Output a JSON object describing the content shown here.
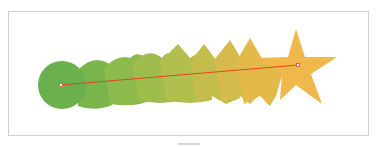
{
  "figure": {
    "start_shape": "circle",
    "end_shape": "star",
    "steps": 8,
    "colors": {
      "start": "#6ab04c",
      "end": "#f0b84a",
      "spine": "#e0452a",
      "frame_border": "#cfcfcf",
      "anchor": "#ffffff"
    }
  }
}
